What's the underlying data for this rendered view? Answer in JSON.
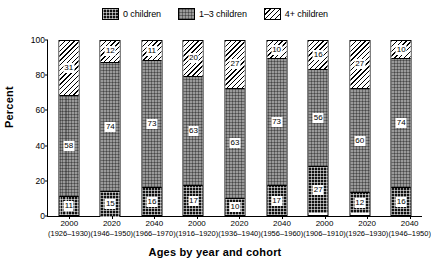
{
  "chart_data": {
    "type": "bar",
    "subtype": "stacked-100-percent",
    "title": "",
    "xlabel": "Ages by year and cohort",
    "ylabel": "Percent",
    "ylim": [
      0,
      100
    ],
    "yticks": [
      0,
      20,
      40,
      60,
      80,
      100
    ],
    "grid": false,
    "legend_position": "top-center",
    "categories": [
      "2000 (1926-1930)",
      "2020 (1946-1950)",
      "2040 (1966-1970)",
      "2000 (1916-1920)",
      "2020 (1936-1940)",
      "2040 (1956-1960)",
      "2000 (1906-1910)",
      "2020 (1926-1930)",
      "2040 (1946-1950)"
    ],
    "x_tick_years": [
      "2000",
      "2020",
      "2040",
      "2000",
      "2020",
      "2040",
      "2000",
      "2020",
      "2040"
    ],
    "x_tick_cohorts": [
      "(1926–1930)",
      "(1946–1950)",
      "(1966–1970)",
      "(1916–1920)",
      "(1936–1940)",
      "(1956–1960)",
      "(1906–1910)",
      "(1926–1930)",
      "(1946–1950)"
    ],
    "series": [
      {
        "name": "0 children",
        "pattern": "cross-hatch-dark",
        "color": "#111111",
        "values": [
          11,
          15,
          16,
          17,
          10,
          17,
          27,
          12,
          16
        ]
      },
      {
        "name": "1–3 children",
        "pattern": "checker-gray",
        "color": "#9a9a9a",
        "values": [
          58,
          74,
          73,
          63,
          63,
          73,
          56,
          60,
          74
        ]
      },
      {
        "name": "4+ children",
        "pattern": "diagonal-hatch",
        "color": "#ffffff",
        "values": [
          31,
          12,
          11,
          20,
          27,
          10,
          16,
          27,
          10
        ]
      }
    ]
  },
  "legend": {
    "entries": [
      {
        "label": "0 children"
      },
      {
        "label": "1–3 children"
      },
      {
        "label": "4+ children"
      }
    ]
  },
  "axes": {
    "y_title": "Percent",
    "x_title": "Ages by year and cohort",
    "y_tick_labels": [
      "100",
      "80",
      "60",
      "40",
      "20",
      "0"
    ]
  }
}
